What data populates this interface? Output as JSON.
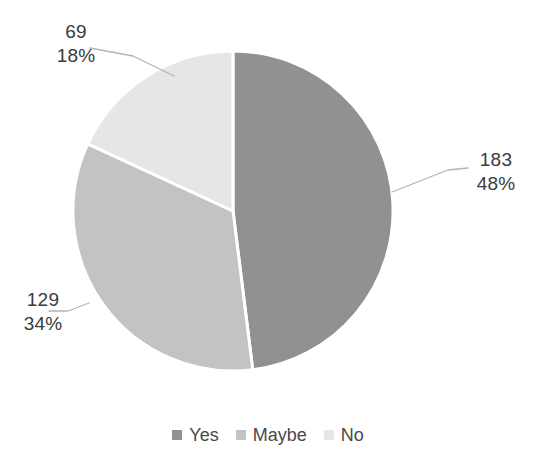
{
  "chart_data": {
    "type": "pie",
    "title": "",
    "subtitle": "",
    "xlabel": "",
    "ylabel": "",
    "grid": false,
    "legend_position": "bottom",
    "total": 381,
    "start_angle_deg": 0,
    "direction": "clockwise",
    "categories": [
      "Yes",
      "Maybe",
      "No"
    ],
    "values": [
      183,
      129,
      69
    ],
    "percents": [
      48,
      34,
      18
    ],
    "slices": [
      {
        "name": "Yes",
        "value": 183,
        "value_text": "183",
        "percent": 48,
        "percent_text": "48%",
        "color": "#919191",
        "start_deg": 0,
        "end_deg": 172.91
      },
      {
        "name": "Maybe",
        "value": 129,
        "value_text": "129",
        "percent": 34,
        "percent_text": "34%",
        "color": "#c3c3c3",
        "start_deg": 172.91,
        "end_deg": 294.8
      },
      {
        "name": "No",
        "value": 69,
        "value_text": "69",
        "percent": 18,
        "percent_text": "18%",
        "color": "#e6e6e6",
        "start_deg": 294.8,
        "end_deg": 360
      }
    ]
  },
  "labels": {
    "no": {
      "value": "69",
      "percent": "18%"
    },
    "yes": {
      "value": "183",
      "percent": "48%"
    },
    "maybe": {
      "value": "129",
      "percent": "34%"
    }
  },
  "legend": {
    "items": [
      {
        "label": "Yes",
        "color": "#919191"
      },
      {
        "label": "Maybe",
        "color": "#c3c3c3"
      },
      {
        "label": "No",
        "color": "#e6e6e6"
      }
    ]
  },
  "colors": {
    "yes": "#919191",
    "maybe": "#c3c3c3",
    "no": "#e6e6e6",
    "slice_separator": "#ffffff",
    "leader_line": "#b4b4b4",
    "label_text": "#3b3b3b",
    "legend_text": "#4a4a4a",
    "background": "#ffffff"
  }
}
